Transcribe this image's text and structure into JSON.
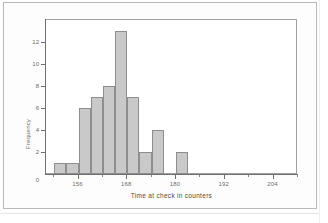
{
  "figure": {
    "background_color": "#ffffff",
    "frame_color": "#b9b9b9",
    "plot_frame_color": "#a0a0a0"
  },
  "chart_data": {
    "type": "bar",
    "title": "",
    "xlabel": "Time at check in counters",
    "ylabel": "Frequency",
    "bin_width": 3,
    "bin_edges": [
      150,
      153,
      156,
      159,
      162,
      165,
      168,
      171,
      174,
      177,
      180,
      183
    ],
    "categories": [
      "150-153",
      "153-156",
      "156-159",
      "159-162",
      "162-165",
      "165-168",
      "168-171",
      "171-174",
      "174-177",
      "177-180",
      "180-183"
    ],
    "values": [
      1,
      1,
      6,
      7,
      8,
      13,
      7,
      2,
      4,
      0,
      2
    ],
    "x": [
      151.5,
      154.5,
      157.5,
      160.5,
      163.5,
      166.5,
      169.5,
      172.5,
      175.5,
      178.5,
      181.5
    ],
    "xlim": [
      148,
      210
    ],
    "ylim": [
      0,
      14
    ],
    "x_ticks_major": [
      156,
      168,
      180,
      192,
      204
    ],
    "x_tick_labels": [
      "156",
      "168",
      "180",
      "192",
      "204"
    ],
    "x_ticks_minor": [
      150,
      162,
      174,
      186,
      198,
      210
    ],
    "y_ticks": [
      0,
      2,
      4,
      6,
      8,
      10,
      12
    ],
    "y_tick_labels": [
      "0",
      "2",
      "4",
      "6",
      "8",
      "10",
      "12"
    ],
    "grid": false,
    "legend": null,
    "bar_fill_color": "#c9c9c9",
    "bar_edge_color": "#8e8e8e"
  }
}
